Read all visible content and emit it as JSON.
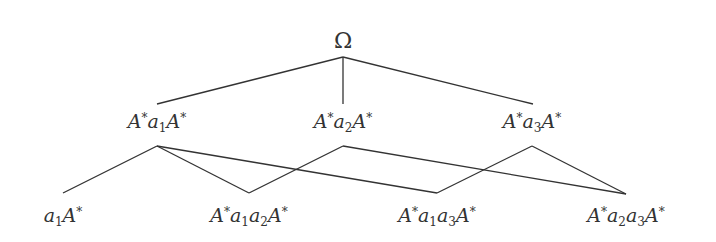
{
  "diagram": {
    "type": "lattice",
    "nodes": [
      {
        "id": "omega",
        "label": "Ω",
        "x": 343,
        "y": 42,
        "level": 0
      },
      {
        "id": "A*a1A*",
        "label": "A*a1A*",
        "x": 157,
        "y": 122,
        "level": 1
      },
      {
        "id": "A*a2A*",
        "label": "A*a2A*",
        "x": 343,
        "y": 122,
        "level": 1
      },
      {
        "id": "A*a3A*",
        "label": "A*a3A*",
        "x": 532,
        "y": 122,
        "level": 1
      },
      {
        "id": "a1A*",
        "label": "a1A*",
        "x": 63,
        "y": 215,
        "level": 2
      },
      {
        "id": "A*a1a2A*",
        "label": "A*a1a2A*",
        "x": 249,
        "y": 215,
        "level": 2
      },
      {
        "id": "A*a1a3A*",
        "label": "A*a1a3A*",
        "x": 437,
        "y": 215,
        "level": 2
      },
      {
        "id": "A*a2a3A*",
        "label": "A*a2a3A*",
        "x": 626,
        "y": 215,
        "level": 2
      }
    ],
    "edges": [
      {
        "from": "omega",
        "to": "A*a1A*",
        "x1": 343,
        "y1": 57,
        "x2": 157,
        "y2": 104
      },
      {
        "from": "omega",
        "to": "A*a2A*",
        "x1": 343,
        "y1": 57,
        "x2": 343,
        "y2": 104
      },
      {
        "from": "omega",
        "to": "A*a3A*",
        "x1": 343,
        "y1": 57,
        "x2": 533,
        "y2": 104
      },
      {
        "from": "A*a1A*",
        "to": "a1A*",
        "x1": 157,
        "y1": 146,
        "x2": 63,
        "y2": 193
      },
      {
        "from": "A*a1A*",
        "to": "A*a1a2A*",
        "x1": 157,
        "y1": 146,
        "x2": 249,
        "y2": 193
      },
      {
        "from": "A*a1A*",
        "to": "A*a1a3A*",
        "x1": 157,
        "y1": 146,
        "x2": 437,
        "y2": 193
      },
      {
        "from": "A*a2A*",
        "to": "A*a1a2A*",
        "x1": 343,
        "y1": 146,
        "x2": 249,
        "y2": 193
      },
      {
        "from": "A*a2A*",
        "to": "A*a2a3A*",
        "x1": 343,
        "y1": 146,
        "x2": 626,
        "y2": 194
      },
      {
        "from": "A*a3A*",
        "to": "A*a1a3A*",
        "x1": 532,
        "y1": 146,
        "x2": 437,
        "y2": 193
      },
      {
        "from": "A*a3A*",
        "to": "A*a2a3A*",
        "x1": 532,
        "y1": 146,
        "x2": 626,
        "y2": 194
      }
    ],
    "colors": {
      "line": "#333333",
      "text": "#333333",
      "background": "#ffffff"
    }
  },
  "labels": {
    "omega": "Ω",
    "A": "A",
    "star": "*",
    "a": "a",
    "one": "1",
    "two": "2",
    "three": "3"
  }
}
